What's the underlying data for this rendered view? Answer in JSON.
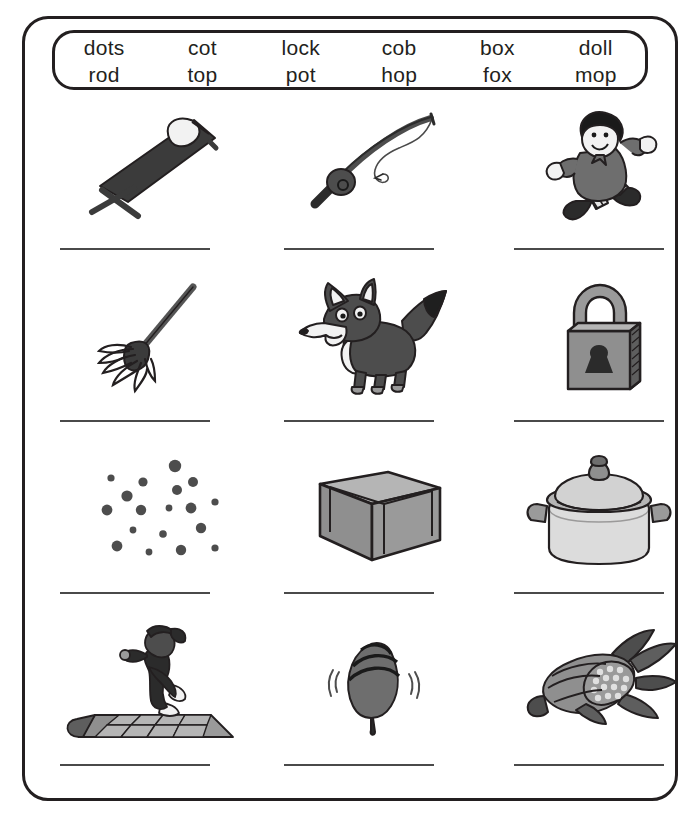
{
  "worksheet": {
    "word_bank": {
      "row1": [
        "dots",
        "cot",
        "lock",
        "cob",
        "box",
        "doll"
      ],
      "row2": [
        "rod",
        "top",
        "pot",
        "hop",
        "fox",
        "mop"
      ]
    },
    "grid": {
      "rows": [
        {
          "cells": [
            {
              "icon": "cot-folding-bed-icon",
              "answer_line": ""
            },
            {
              "icon": "fishing-rod-icon",
              "answer_line": ""
            },
            {
              "icon": "doll-icon",
              "answer_line": ""
            }
          ]
        },
        {
          "cells": [
            {
              "icon": "mop-icon",
              "answer_line": ""
            },
            {
              "icon": "fox-icon",
              "answer_line": ""
            },
            {
              "icon": "padlock-icon",
              "answer_line": ""
            }
          ]
        },
        {
          "cells": [
            {
              "icon": "dots-icon",
              "answer_line": ""
            },
            {
              "icon": "box-icon",
              "answer_line": ""
            },
            {
              "icon": "cooking-pot-icon",
              "answer_line": ""
            }
          ]
        },
        {
          "cells": [
            {
              "icon": "hopscotch-hop-icon",
              "answer_line": ""
            },
            {
              "icon": "spinning-top-icon",
              "answer_line": ""
            },
            {
              "icon": "corn-cob-icon",
              "answer_line": ""
            }
          ]
        }
      ]
    },
    "colors": {
      "ink": "#231f20",
      "line": "#4a4a4a",
      "gray_dark": "#4d4d4d",
      "gray_mid": "#808080",
      "gray_light": "#b3b3b3",
      "paper": "#ffffff"
    }
  }
}
